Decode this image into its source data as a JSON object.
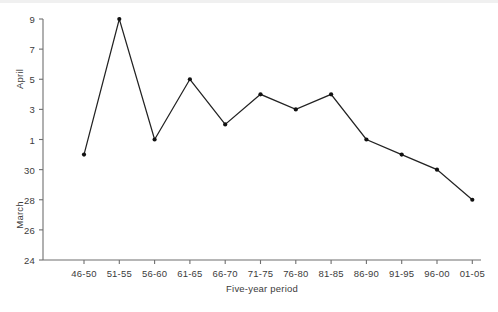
{
  "chart_data": {
    "type": "line",
    "title": "",
    "xlabel": "Five-year period",
    "ylabel": "",
    "y_group_labels": [
      "March",
      "April"
    ],
    "categories": [
      "46-50",
      "51-55",
      "56-60",
      "61-65",
      "66-70",
      "71-75",
      "76-80",
      "81-85",
      "86-90",
      "91-95",
      "96-00",
      "01-05"
    ],
    "values": [
      0,
      9,
      1,
      5,
      2,
      4,
      3,
      4,
      1,
      0,
      -1,
      -3
    ],
    "value_labels": [
      "March 31",
      "April 9",
      "April 1",
      "April 5",
      "April 2",
      "April 4",
      "April 3",
      "April 4",
      "April 1",
      "March 31",
      "March 30",
      "March 28"
    ],
    "ytick_values": [
      -7,
      -5,
      -3,
      -1,
      1,
      3,
      5,
      7,
      9
    ],
    "ytick_labels": [
      "24",
      "26",
      "28",
      "30",
      "1",
      "3",
      "5",
      "7",
      "9"
    ],
    "ylim": [
      -7,
      9
    ],
    "grid": false,
    "legend": false,
    "line_color": "#222222",
    "marker": "dot",
    "marker_color": "#111111"
  },
  "axes": {
    "x_title": "Five-year period",
    "y_upper_title": "April",
    "y_lower_title": "March"
  }
}
